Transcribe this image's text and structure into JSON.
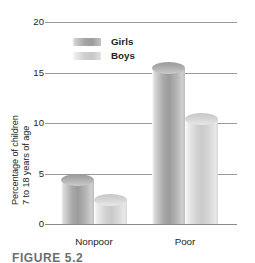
{
  "chart_data": {
    "type": "bar",
    "title": "",
    "xlabel": "",
    "ylabel_line1": "Percentage of children",
    "ylabel_line2": "7 to 18 years of age",
    "categories": [
      "Nonpoor",
      "Poor"
    ],
    "series": [
      {
        "name": "Girls",
        "values": [
          5,
          16
        ],
        "color": "#9e9e9e"
      },
      {
        "name": "Boys",
        "values": [
          3,
          11
        ],
        "color": "#d2d2d2"
      }
    ],
    "ylim": [
      0,
      20
    ],
    "yticks": [
      "0",
      "5",
      "10",
      "15",
      "20"
    ],
    "ytick_values": [
      0,
      5,
      10,
      15,
      20
    ],
    "grid": true,
    "legend_position": "top-center"
  },
  "legend": {
    "items": [
      {
        "label": "Girls"
      },
      {
        "label": "Boys"
      }
    ]
  },
  "caption": {
    "text": "FIGURE 5.2"
  }
}
